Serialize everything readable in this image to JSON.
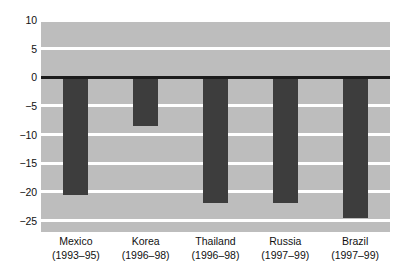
{
  "chart_data": {
    "type": "bar",
    "title": "",
    "subtitle": "",
    "xlabel": "",
    "ylabel": "",
    "categories": [
      "Mexico",
      "Korea",
      "Thailand",
      "Russia",
      "Brazil"
    ],
    "category_periods": [
      "(1993–95)",
      "(1996–98)",
      "(1996–98)",
      "(1997–99)",
      "(1997–99)"
    ],
    "values": [
      -20.6,
      -8.5,
      -22.0,
      -22.0,
      -24.5
    ],
    "ylim": [
      -27,
      10
    ],
    "yticks": [
      10,
      5,
      0,
      -5,
      -10,
      -15,
      -20,
      -25
    ],
    "ytick_labels": [
      "10",
      "5",
      "0",
      "−5",
      "−10",
      "−15",
      "−20",
      "−25"
    ],
    "grid": true,
    "gridlines_at": [
      10,
      5,
      -5,
      -10,
      -15,
      -20,
      -25
    ],
    "zero_line": 0,
    "legend": null,
    "annotations": [],
    "colors": {
      "bar": "#3d3d3d",
      "plot_background": "#bdbdbd",
      "gridline": "#ffffff",
      "zero_line": "#1c1c1c",
      "text": "#111111",
      "figure_background": "#ffffff"
    }
  }
}
